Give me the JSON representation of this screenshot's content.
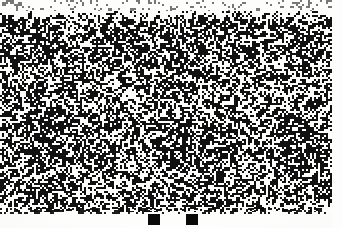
{
  "page": {
    "width": 342,
    "height": 228,
    "background_color": "#fbfbf9",
    "paper_color": "#fdfdfb",
    "ink_color": "#0a0a0a"
  },
  "noise_field": {
    "name": "dithered-noise-field",
    "x": 0,
    "y": 11,
    "width": 332,
    "height": 201,
    "fill_color": "#111111",
    "background_color": "#fdfdfb",
    "density": 0.49,
    "cell_size": 2,
    "seed": 20240517
  },
  "top_speckle_band": {
    "name": "top-speckle-band",
    "x": 0,
    "y": 0,
    "width": 342,
    "height": 11,
    "density": 0.1,
    "cell_size": 2,
    "seed": 7731
  },
  "bottom_fringe": {
    "name": "bottom-noise-fringe",
    "x": 0,
    "y": 208,
    "width": 332,
    "height": 6,
    "density": 0.34,
    "cell_size": 2,
    "seed": 4412
  },
  "right_margin": {
    "name": "right-paper-margin",
    "x": 332,
    "width": 10
  },
  "markers": [
    {
      "name": "marker-square-left",
      "x": 148,
      "y": 214,
      "width": 12,
      "height": 11,
      "color": "#0a0a0a"
    },
    {
      "name": "marker-square-right",
      "x": 186,
      "y": 214,
      "width": 12,
      "height": 11,
      "color": "#0a0a0a"
    }
  ]
}
